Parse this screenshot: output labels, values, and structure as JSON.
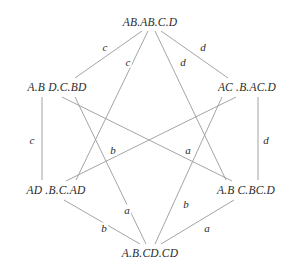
{
  "diagram": {
    "type": "hexagonal-lattice-graph",
    "background_color": "#ffffff",
    "edge_color": "#9a9a9a",
    "text_color": "#2b2b2b",
    "nodes": [
      {
        "id": "top",
        "label": "AB.AB.C.D",
        "x": 150,
        "y": 22
      },
      {
        "id": "upper-left",
        "label": "A.B D.C.BD",
        "x": 57,
        "y": 87
      },
      {
        "id": "upper-right",
        "label": "AC .B.AC.D",
        "x": 247,
        "y": 87
      },
      {
        "id": "lower-left",
        "label": "AD .B.C.AD",
        "x": 56,
        "y": 190
      },
      {
        "id": "lower-right",
        "label": "A.B C.BC.D",
        "x": 246,
        "y": 190
      },
      {
        "id": "bottom",
        "label": "A.B.CD.CD",
        "x": 150,
        "y": 253
      }
    ],
    "edges": [
      {
        "from": "top",
        "to": "upper-left",
        "label": "c",
        "label_x": 105,
        "label_y": 47,
        "x1": 142,
        "y1": 31,
        "x2": 75,
        "y2": 78
      },
      {
        "from": "top",
        "to": "lower-left",
        "label": "c",
        "label_x": 128,
        "label_y": 62,
        "x1": 148,
        "y1": 31,
        "x2": 76,
        "y2": 180
      },
      {
        "from": "top",
        "to": "lower-right",
        "label": "d",
        "label_x": 183,
        "label_y": 62,
        "x1": 155,
        "y1": 31,
        "x2": 226,
        "y2": 180
      },
      {
        "from": "top",
        "to": "upper-right",
        "label": "d",
        "label_x": 203,
        "label_y": 47,
        "x1": 161,
        "y1": 31,
        "x2": 228,
        "y2": 78
      },
      {
        "from": "upper-left",
        "to": "lower-left",
        "label": "c",
        "label_x": 32,
        "label_y": 140,
        "x1": 42,
        "y1": 97,
        "x2": 42,
        "y2": 180
      },
      {
        "from": "upper-right",
        "to": "lower-right",
        "label": "d",
        "label_x": 266,
        "label_y": 140,
        "x1": 258,
        "y1": 97,
        "x2": 258,
        "y2": 180
      },
      {
        "from": "upper-left",
        "to": "lower-right",
        "label": "b",
        "label_x": 113,
        "label_y": 150,
        "x1": 62,
        "y1": 97,
        "x2": 232,
        "y2": 181
      },
      {
        "from": "upper-right",
        "to": "lower-left",
        "label": "a",
        "label_x": 188,
        "label_y": 150,
        "x1": 236,
        "y1": 97,
        "x2": 66,
        "y2": 181
      },
      {
        "from": "lower-left",
        "to": "bottom",
        "label": "b",
        "label_x": 104,
        "label_y": 228,
        "x1": 64,
        "y1": 200,
        "x2": 140,
        "y2": 244
      },
      {
        "from": "upper-left",
        "to": "bottom",
        "label": "a",
        "label_x": 127,
        "label_y": 210,
        "x1": 75,
        "y1": 97,
        "x2": 146,
        "y2": 244
      },
      {
        "from": "upper-right",
        "to": "bottom",
        "label": "b",
        "label_x": 186,
        "label_y": 204,
        "x1": 222,
        "y1": 97,
        "x2": 155,
        "y2": 244
      },
      {
        "from": "lower-right",
        "to": "bottom",
        "label": "a",
        "label_x": 207,
        "label_y": 228,
        "x1": 234,
        "y1": 200,
        "x2": 161,
        "y2": 244
      }
    ]
  }
}
